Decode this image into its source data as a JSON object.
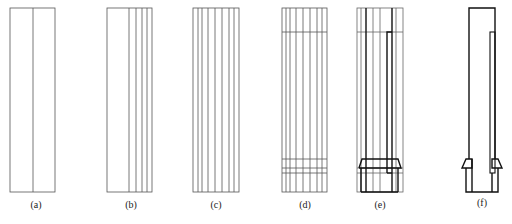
{
  "figure": {
    "panels": [
      {
        "id": "a",
        "label": "(a)"
      },
      {
        "id": "b",
        "label": "(b)"
      },
      {
        "id": "c",
        "label": "(c)"
      },
      {
        "id": "d",
        "label": "(d)"
      },
      {
        "id": "e",
        "label": "(e)"
      },
      {
        "id": "f",
        "label": "(f)"
      }
    ],
    "colors": {
      "line": "#444444",
      "bold_line": "#111111",
      "background": "#ffffff"
    }
  }
}
